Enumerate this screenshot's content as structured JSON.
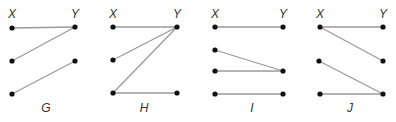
{
  "colors": {
    "edge": "#9a9a9a",
    "node": "#111111",
    "text": "#333333"
  },
  "diagrams": [
    {
      "name": "G",
      "column_labels": {
        "x": "X",
        "y": "Y"
      },
      "nodes": [
        [
          12,
          28
        ],
        [
          12,
          61
        ],
        [
          12,
          94
        ],
        [
          75,
          27
        ],
        [
          75,
          61
        ]
      ],
      "edges": [
        [
          [
            12,
            28
          ],
          [
            75,
            27
          ]
        ],
        [
          [
            12,
            61
          ],
          [
            75,
            27
          ]
        ],
        [
          [
            12,
            94
          ],
          [
            75,
            61
          ]
        ]
      ],
      "label_pos": [
        46,
        112
      ],
      "x_label_pos": [
        12,
        18
      ],
      "y_label_pos": [
        75,
        18
      ]
    },
    {
      "name": "H",
      "column_labels": {
        "x": "X",
        "y": "Y"
      },
      "nodes": [
        [
          113,
          27
        ],
        [
          113,
          60
        ],
        [
          113,
          93
        ],
        [
          177,
          27
        ],
        [
          177,
          93
        ]
      ],
      "edges": [
        [
          [
            113,
            27
          ],
          [
            177,
            27
          ]
        ],
        [
          [
            113,
            60
          ],
          [
            177,
            27
          ]
        ],
        [
          [
            113,
            93
          ],
          [
            177,
            27
          ]
        ],
        [
          [
            113,
            93
          ],
          [
            177,
            93
          ]
        ]
      ],
      "label_pos": [
        144,
        112
      ],
      "x_label_pos": [
        113,
        18
      ],
      "y_label_pos": [
        177,
        18
      ]
    },
    {
      "name": "I",
      "column_labels": {
        "x": "X",
        "y": "Y"
      },
      "nodes": [
        [
          215,
          27
        ],
        [
          215,
          50
        ],
        [
          215,
          71
        ],
        [
          215,
          94
        ],
        [
          283,
          27
        ],
        [
          283,
          71
        ],
        [
          283,
          94
        ]
      ],
      "edges": [
        [
          [
            215,
            27
          ],
          [
            283,
            27
          ]
        ],
        [
          [
            215,
            50
          ],
          [
            283,
            71
          ]
        ],
        [
          [
            215,
            71
          ],
          [
            283,
            71
          ]
        ],
        [
          [
            215,
            94
          ],
          [
            283,
            94
          ]
        ]
      ],
      "label_pos": [
        252,
        112
      ],
      "x_label_pos": [
        215,
        18
      ],
      "y_label_pos": [
        283,
        18
      ]
    },
    {
      "name": "J",
      "column_labels": {
        "x": "X",
        "y": "Y"
      },
      "nodes": [
        [
          320,
          27
        ],
        [
          319,
          61
        ],
        [
          320,
          94
        ],
        [
          383,
          27
        ],
        [
          383,
          61
        ],
        [
          383,
          94
        ]
      ],
      "edges": [
        [
          [
            320,
            27
          ],
          [
            383,
            27
          ]
        ],
        [
          [
            320,
            27
          ],
          [
            383,
            61
          ]
        ],
        [
          [
            319,
            61
          ],
          [
            383,
            94
          ]
        ],
        [
          [
            320,
            94
          ],
          [
            383,
            94
          ]
        ]
      ],
      "label_pos": [
        350,
        112
      ],
      "x_label_pos": [
        320,
        18
      ],
      "y_label_pos": [
        383,
        18
      ]
    }
  ]
}
